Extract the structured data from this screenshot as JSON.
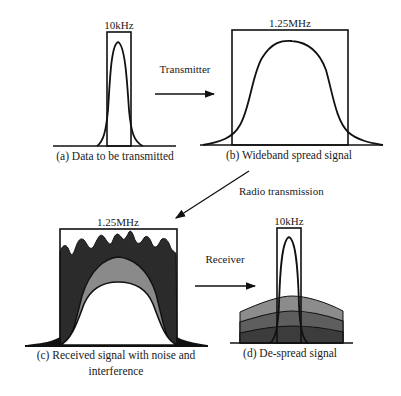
{
  "panels": {
    "a": {
      "bandwidth_label": "10kHz",
      "caption": "(a) Data to be transmitted"
    },
    "b": {
      "bandwidth_label": "1.25MHz",
      "caption": "(b) Wideband spread signal"
    },
    "c": {
      "bandwidth_label": "1.25MHz",
      "caption_line1": "(c) Received signal with noise and",
      "caption_line2": "interference"
    },
    "d": {
      "bandwidth_label": "10kHz",
      "caption": "(d) De-spread signal"
    }
  },
  "arrows": {
    "transmitter": "Transmitter",
    "radio": "Radio transmission",
    "receiver": "Receiver"
  },
  "colors": {
    "line": "#111111",
    "noise_dark": "#2b2b2b",
    "interference_mid": "#8a8a8a",
    "layer_light": "#8c8c8c",
    "layer_mid": "#5e5e5e",
    "layer_dark": "#3c3c3c",
    "background": "#ffffff"
  }
}
